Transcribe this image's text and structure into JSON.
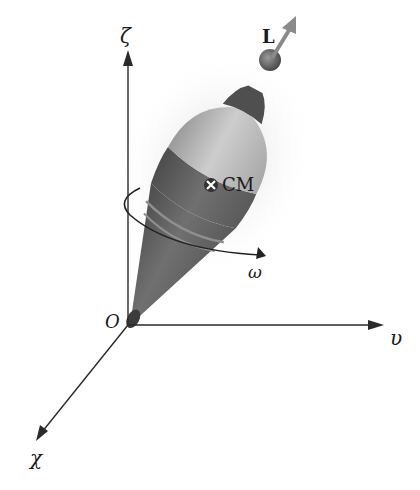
{
  "figure": {
    "axes": {
      "vertical_label": "ζ",
      "horizontal_label": "υ",
      "depth_label": "χ",
      "origin_label": "O"
    },
    "vector_label": "L",
    "center_of_mass_label": "CM",
    "angular_velocity_label": "ω",
    "colors": {
      "axis": "#2a2a2a",
      "top_light": "#b5b5b5",
      "top_dark": "#595959",
      "arrow": "#8a8a8a",
      "text": "#1a1a1a"
    }
  }
}
